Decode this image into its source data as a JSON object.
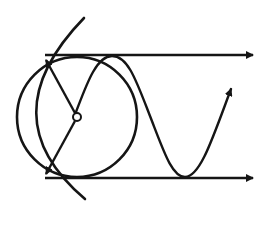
{
  "diagram": {
    "colors": {
      "stroke": "#151515",
      "background": "#ffffff"
    },
    "elements": {
      "circle": {
        "cx": 77,
        "cy": 117,
        "r": 60
      },
      "center_point": {
        "cx": 77,
        "cy": 117,
        "r": 4
      },
      "outer_arc": {
        "start": [
          84,
          18
        ],
        "control": [
          -12,
          117
        ],
        "end": [
          85,
          199
        ]
      },
      "top_arrow": {
        "x1": 45,
        "y1": 55,
        "x2": 253,
        "y2": 55
      },
      "bottom_arrow": {
        "x1": 45,
        "y1": 178,
        "x2": 253,
        "y2": 178
      },
      "radius_arrow_up": {
        "x1": 77,
        "y1": 117,
        "x2": 45,
        "y2": 59
      },
      "radius_arrow_down": {
        "x1": 77,
        "y1": 117,
        "x2": 45,
        "y2": 175
      },
      "sine_wave": {
        "start": [
          75,
          112
        ],
        "peak": [
          112,
          56
        ],
        "trough": [
          185,
          177
        ],
        "end": [
          232,
          86
        ]
      }
    },
    "labels": []
  }
}
